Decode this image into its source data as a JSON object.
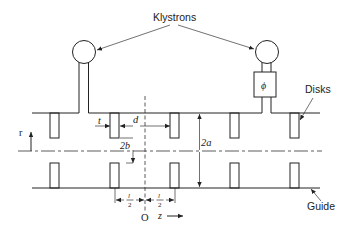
{
  "diagram": {
    "labels": {
      "klystrons": "Klystrons",
      "disks": "Disks",
      "guide": "Guide",
      "phase_shifter": "ϕ",
      "r_axis": "r",
      "z_axis": "z",
      "origin": "O",
      "t": "t",
      "d": "d",
      "two_b": "2b",
      "two_a": "2a",
      "half_l_num": "l",
      "half_l_den": "2"
    },
    "disk_count_per_wall": 5,
    "klystron_count": 2
  }
}
